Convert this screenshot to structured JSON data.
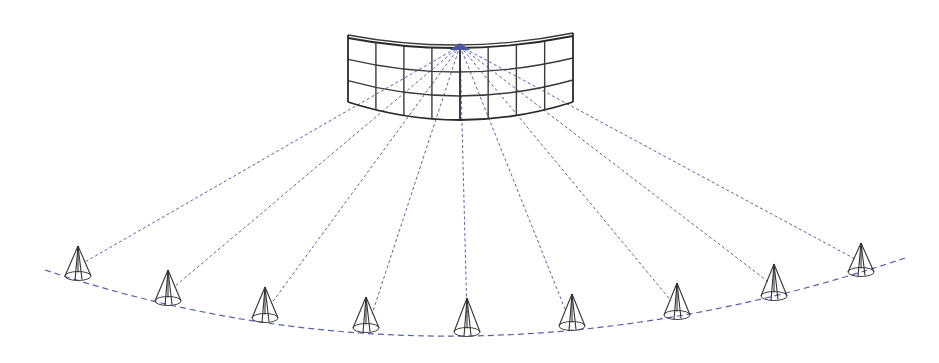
{
  "diagram": {
    "colors": {
      "ray": "#5a63a8",
      "screen": "#3a3a3a",
      "cone": "#333333",
      "background": "#ffffff"
    },
    "screen": {
      "columns": 8,
      "rows": 3,
      "left_edge": {
        "x": 348,
        "top": 38,
        "bottom": 102
      },
      "right_edge": {
        "x": 573,
        "top": 36,
        "bottom": 102
      },
      "center": {
        "x": 460,
        "top": 48,
        "bottom": 120
      }
    },
    "emitter": {
      "x": 460,
      "y": 46
    },
    "cones": [
      {
        "x": 78,
        "tip": 246,
        "base": 276
      },
      {
        "x": 168,
        "tip": 270,
        "base": 301
      },
      {
        "x": 265,
        "tip": 287,
        "base": 318
      },
      {
        "x": 366,
        "tip": 297,
        "base": 328
      },
      {
        "x": 467,
        "tip": 298,
        "base": 332
      },
      {
        "x": 572,
        "tip": 294,
        "base": 326
      },
      {
        "x": 677,
        "tip": 283,
        "base": 315
      },
      {
        "x": 774,
        "tip": 264,
        "base": 296
      },
      {
        "x": 861,
        "tip": 243,
        "base": 272
      }
    ],
    "arc": {
      "start": [
        45,
        270
      ],
      "mid": [
        467,
        336
      ],
      "end": [
        905,
        258
      ]
    },
    "labels": []
  }
}
